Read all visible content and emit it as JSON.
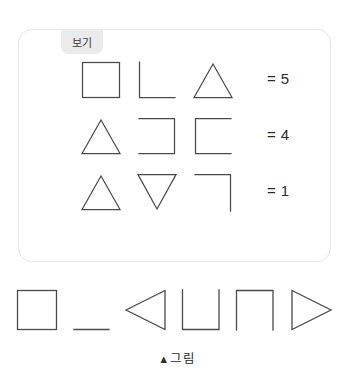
{
  "example_panel": {
    "tab_label": "보기",
    "rows": [
      {
        "shapes": [
          "square",
          "corner-bottom-left",
          "triangle-up"
        ],
        "equals_sign": "=",
        "value": "5"
      },
      {
        "shapes": [
          "triangle-up",
          "bracket-open-left",
          "bracket-open-right"
        ],
        "equals_sign": "=",
        "value": "4"
      },
      {
        "shapes": [
          "triangle-up",
          "triangle-down",
          "corner-top-right"
        ],
        "equals_sign": "=",
        "value": "1"
      }
    ]
  },
  "answer_row": {
    "shapes": [
      "square",
      "horizontal-line",
      "triangle-left",
      "u-shape",
      "arch-shape",
      "triangle-right"
    ]
  },
  "caption": {
    "marker": "▲",
    "text": "그림"
  },
  "colors": {
    "stroke": "#4a4a4a",
    "panel_border": "#e6e6e6",
    "tab_background": "#ebebeb",
    "text": "#2b2b2b",
    "page_background": "#ffffff"
  }
}
